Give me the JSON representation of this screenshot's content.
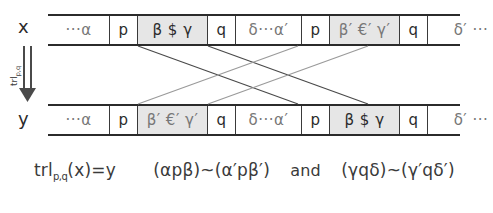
{
  "figure": {
    "caption_formula": "trl",
    "caption_formula_sub": "p,q",
    "caption_formula_rest": "(x)=y",
    "caption_rel_left": "(αpβ)~(α′pβ′)",
    "caption_conjunction": "and",
    "caption_rel_right": "(γqδ)~(γ′qδ′)",
    "input_label": "x",
    "output_label": "y",
    "arrow_label": "trl",
    "arrow_label_sub": "p,q",
    "arrow_glyph": "⇓"
  },
  "tapes": [
    {
      "name": "input-tape",
      "label": "x",
      "cells": [
        {
          "text": "···α",
          "shaded": false,
          "ghost": true,
          "width": "w-alpha"
        },
        {
          "text": "p",
          "shaded": false,
          "ghost": false,
          "width": "w-state"
        },
        {
          "text": "β $ γ",
          "shaded": true,
          "ghost": false,
          "width": "w-block"
        },
        {
          "text": "q",
          "shaded": false,
          "ghost": false,
          "width": "w-state"
        },
        {
          "text": "δ···α′",
          "shaded": false,
          "ghost": true,
          "width": "w-mid"
        },
        {
          "text": "p",
          "shaded": false,
          "ghost": false,
          "width": "w-state"
        },
        {
          "text": "β′ €′ γ′",
          "shaded": true,
          "ghost": true,
          "width": "w-block"
        },
        {
          "text": "q",
          "shaded": false,
          "ghost": false,
          "width": "w-state"
        },
        {
          "text": "δ′ ···",
          "shaded": false,
          "ghost": true,
          "width": "w-tail"
        }
      ]
    },
    {
      "name": "output-tape",
      "label": "y",
      "cells": [
        {
          "text": "···α",
          "shaded": false,
          "ghost": true,
          "width": "w-alpha"
        },
        {
          "text": "p",
          "shaded": false,
          "ghost": false,
          "width": "w-state"
        },
        {
          "text": "β′ €′ γ′",
          "shaded": true,
          "ghost": true,
          "width": "w-block"
        },
        {
          "text": "q",
          "shaded": false,
          "ghost": false,
          "width": "w-state"
        },
        {
          "text": "δ···α′",
          "shaded": false,
          "ghost": true,
          "width": "w-mid"
        },
        {
          "text": "p",
          "shaded": false,
          "ghost": false,
          "width": "w-state"
        },
        {
          "text": "β $ γ",
          "shaded": true,
          "ghost": false,
          "width": "w-block"
        },
        {
          "text": "q",
          "shaded": false,
          "ghost": false,
          "width": "w-state"
        },
        {
          "text": "δ′ ···",
          "shaded": false,
          "ghost": true,
          "width": "w-tail"
        }
      ]
    }
  ],
  "connector_lines": [
    {
      "name": "left-block-to-right-slot-lower",
      "x1": 138,
      "y1": 46,
      "x2": 298,
      "y2": 104,
      "color": "#4a4a4a"
    },
    {
      "name": "left-block-end-to-right-slot-end",
      "x1": 208,
      "y1": 46,
      "x2": 368,
      "y2": 104,
      "color": "#4a4a4a"
    },
    {
      "name": "right-block-to-left-slot-upper",
      "x1": 298,
      "y1": 46,
      "x2": 138,
      "y2": 104,
      "color": "#9a9a9a"
    },
    {
      "name": "right-block-end-to-left-slot-end",
      "x1": 368,
      "y1": 46,
      "x2": 208,
      "y2": 104,
      "color": "#9a9a9a"
    }
  ],
  "colors": {
    "tape_border": "#2b2b2b",
    "cell_divider": "#3a3a3a",
    "shaded_cell": "#e6e6e6",
    "text": "#2b2b2b",
    "ghost_text": "#777777",
    "background": "#ffffff"
  }
}
